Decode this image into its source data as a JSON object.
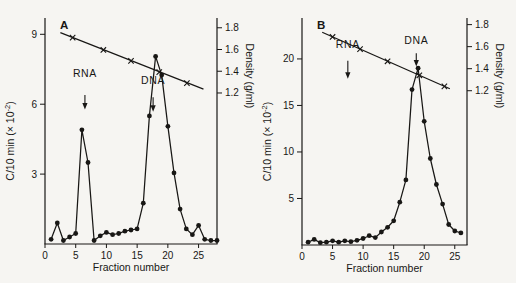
{
  "figure": {
    "background": "#f6f5f2",
    "ink": "#181715"
  },
  "chart_data": [
    {
      "type": "line",
      "panel_label": "A",
      "xlabel": "Fraction number",
      "ylabel_left": {
        "text": "C/10 min (× 10",
        "sup": "-2",
        "close": ")"
      },
      "ylabel_right": "Density (g/ml)",
      "xlim": [
        0,
        28
      ],
      "x_ticks": [
        0,
        5,
        10,
        15,
        20,
        25
      ],
      "ylim_left": [
        0,
        9.7
      ],
      "y_ticks_left": [
        3,
        6,
        9
      ],
      "right_axis": {
        "ticks": [
          1.2,
          1.4,
          1.6,
          1.8
        ],
        "value_top": 1.89,
        "value_bottom": -0.19
      },
      "series": [
        {
          "name": "counts",
          "marker": "dot",
          "points": [
            [
              1,
              0.2
            ],
            [
              2,
              0.9
            ],
            [
              3,
              0.15
            ],
            [
              4,
              0.3
            ],
            [
              5,
              0.45
            ],
            [
              6,
              4.9
            ],
            [
              7,
              3.5
            ],
            [
              8,
              0.15
            ],
            [
              9,
              0.35
            ],
            [
              10,
              0.5
            ],
            [
              11,
              0.4
            ],
            [
              12,
              0.45
            ],
            [
              13,
              0.55
            ],
            [
              14,
              0.6
            ],
            [
              15,
              0.65
            ],
            [
              16,
              1.75
            ],
            [
              17,
              5.5
            ],
            [
              18,
              8.05
            ],
            [
              19,
              7.25
            ],
            [
              20,
              5.05
            ],
            [
              21,
              3.05
            ],
            [
              22,
              1.5
            ],
            [
              23,
              0.65
            ],
            [
              24,
              0.4
            ],
            [
              25,
              0.8
            ],
            [
              26,
              0.2
            ],
            [
              27,
              0.15
            ],
            [
              28,
              0.15
            ]
          ]
        },
        {
          "name": "density",
          "marker": "x",
          "axis": "right",
          "line": [
            [
              2.5,
              1.755
            ],
            [
              25.8,
              1.235
            ]
          ],
          "marker_points": [
            [
              4.5,
              1.709
            ],
            [
              9.5,
              1.596
            ],
            [
              14,
              1.495
            ],
            [
              18.6,
              1.392
            ],
            [
              23.1,
              1.291
            ]
          ]
        }
      ],
      "annotations": [
        {
          "text": "RNA",
          "x": 6.5,
          "text_y": 7.15,
          "arrow_from": 6.4,
          "arrow_to": 5.9
        },
        {
          "text": "DNA",
          "x": 17.6,
          "text_y": 6.85,
          "arrow_from": 6.3,
          "arrow_to": 5.8
        }
      ]
    },
    {
      "type": "line",
      "panel_label": "B",
      "xlabel": "Fraction number",
      "ylabel_left": {
        "text": "C/10 min (× 10",
        "sup": "-2",
        "close": ")"
      },
      "ylabel_right": "Density (g/ml)",
      "xlim": [
        0,
        27
      ],
      "x_ticks": [
        0,
        5,
        10,
        15,
        20,
        25
      ],
      "ylim_left": [
        0,
        24.4
      ],
      "y_ticks_left": [
        5,
        10,
        15,
        20
      ],
      "right_axis": {
        "ticks": [
          1.2,
          1.4,
          1.6,
          1.8
        ],
        "value_top": 1.86,
        "value_bottom": -0.2
      },
      "series": [
        {
          "name": "counts",
          "marker": "dot",
          "points": [
            [
              1,
              0.3
            ],
            [
              2,
              0.6
            ],
            [
              3,
              0.25
            ],
            [
              4,
              0.3
            ],
            [
              5,
              0.45
            ],
            [
              6,
              0.3
            ],
            [
              7,
              0.45
            ],
            [
              8,
              0.35
            ],
            [
              9,
              0.5
            ],
            [
              10,
              0.7
            ],
            [
              11,
              1.0
            ],
            [
              12,
              0.8
            ],
            [
              13,
              1.4
            ],
            [
              14,
              1.9
            ],
            [
              15,
              2.6
            ],
            [
              16,
              4.6
            ],
            [
              17,
              7.0
            ],
            [
              18,
              16.7
            ],
            [
              19,
              19.0
            ],
            [
              20,
              13.3
            ],
            [
              21,
              9.3
            ],
            [
              22,
              6.5
            ],
            [
              23,
              4.4
            ],
            [
              24,
              2.2
            ],
            [
              25,
              1.5
            ],
            [
              26,
              1.3
            ]
          ]
        },
        {
          "name": "density",
          "marker": "x",
          "axis": "right",
          "line": [
            [
              3.3,
              1.73
            ],
            [
              24.2,
              1.218
            ]
          ],
          "marker_points": [
            [
              5,
              1.688
            ],
            [
              9.5,
              1.577
            ],
            [
              14,
              1.467
            ],
            [
              19.2,
              1.34
            ],
            [
              23.3,
              1.24
            ]
          ]
        }
      ],
      "annotations": [
        {
          "text": "RNA",
          "x": 7.5,
          "text_y": 21.2,
          "arrow_from": 19.8,
          "arrow_to": 18.2
        },
        {
          "text": "DNA",
          "x": 18.7,
          "text_y": 21.6,
          "arrow_from": 20.6,
          "arrow_to": 19.5
        }
      ]
    }
  ]
}
